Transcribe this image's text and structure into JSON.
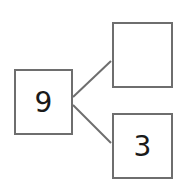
{
  "number_bond": {
    "whole": "9",
    "part_top": "",
    "part_bottom": "3"
  },
  "colors": {
    "border": "#6e6e6e",
    "line": "#6e6e6e",
    "text": "#1a1a1a"
  }
}
